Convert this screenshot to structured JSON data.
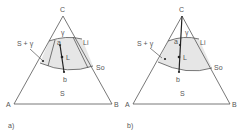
{
  "colors": {
    "line": "#555555",
    "shade": "#e6e6e6",
    "text": "#555555",
    "background": "#ffffff"
  },
  "diagrams": [
    {
      "id": "a",
      "caption": "a)",
      "vertices": {
        "top": "C",
        "left": "A",
        "right": "B"
      },
      "regions": {
        "liquid": "γ",
        "solid": "S",
        "two_phase_label": "S + γ"
      },
      "curves": {
        "liquidus": "Li",
        "solidus": "So"
      },
      "points": {
        "upper": "a",
        "lower": "b",
        "middle": "L"
      }
    },
    {
      "id": "b",
      "caption": "b)",
      "vertices": {
        "top": "C",
        "left": "A",
        "right": "B"
      },
      "regions": {
        "liquid": "γ",
        "solid": "S",
        "two_phase_label": "S + γ"
      },
      "curves": {
        "liquidus": "Li",
        "solidus": "So"
      },
      "points": {
        "upper": "a",
        "lower": "b",
        "middle": "L"
      }
    }
  ]
}
